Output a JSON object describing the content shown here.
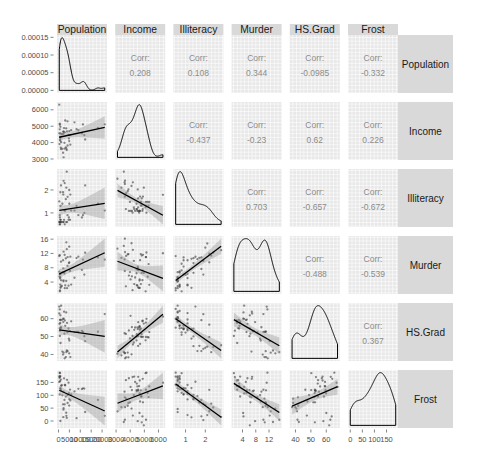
{
  "strips": {
    "top": [
      "Population",
      "Income",
      "Illiteracy",
      "Murder",
      "HS.Grad",
      "Frost"
    ],
    "right": [
      "Population",
      "Income",
      "Illiteracy",
      "Murder",
      "HS.Grad",
      "Frost"
    ]
  },
  "chart_data": {
    "type": "scatter",
    "layout": "scatterplot-matrix",
    "title": "",
    "grid": true,
    "variables": [
      "Population",
      "Income",
      "Illiteracy",
      "Murder",
      "HS.Grad",
      "Frost"
    ],
    "panels": {
      "lower": "scatter points with linear fit line and 95% confidence band",
      "diagonal": "kernel density curve",
      "upper": "correlation coefficient text"
    },
    "colors": {
      "panel_bg": "#E8E8E8",
      "strip_bg": "#D9D9D9",
      "point": "#3a3a3a",
      "fit_line": "#000000",
      "ci_band": "#999999",
      "density_line": "#000000",
      "corr_text": "#8C8C8C"
    },
    "corr_label": "Corr:",
    "correlations": [
      {
        "row": "Population",
        "col": "Income",
        "value": "0.208"
      },
      {
        "row": "Population",
        "col": "Illiteracy",
        "value": "0.108"
      },
      {
        "row": "Population",
        "col": "Murder",
        "value": "0.344"
      },
      {
        "row": "Population",
        "col": "HS.Grad",
        "value": "-0.0985"
      },
      {
        "row": "Population",
        "col": "Frost",
        "value": "-0.332"
      },
      {
        "row": "Income",
        "col": "Illiteracy",
        "value": "-0.437"
      },
      {
        "row": "Income",
        "col": "Murder",
        "value": "-0.23"
      },
      {
        "row": "Income",
        "col": "HS.Grad",
        "value": "0.62"
      },
      {
        "row": "Income",
        "col": "Frost",
        "value": "0.226"
      },
      {
        "row": "Illiteracy",
        "col": "Murder",
        "value": "0.703"
      },
      {
        "row": "Illiteracy",
        "col": "HS.Grad",
        "value": "-0.657"
      },
      {
        "row": "Illiteracy",
        "col": "Frost",
        "value": "-0.672"
      },
      {
        "row": "Murder",
        "col": "HS.Grad",
        "value": "-0.488"
      },
      {
        "row": "Murder",
        "col": "Frost",
        "value": "-0.539"
      },
      {
        "row": "HS.Grad",
        "col": "Frost",
        "value": "0.367"
      }
    ],
    "axis_ticks": {
      "y": [
        {
          "variable": "Population (density)",
          "values": [
            0,
            5e-05,
            0.0001,
            0.00015
          ],
          "labels": [
            "0.00000",
            "0.00005",
            "0.00010",
            "0.00015"
          ]
        },
        {
          "variable": "Income",
          "values": [
            3000,
            4000,
            5000,
            6000
          ],
          "labels": [
            "3000",
            "4000",
            "5000",
            "6000"
          ]
        },
        {
          "variable": "Illiteracy",
          "values": [
            1,
            2
          ],
          "labels": [
            "1",
            "2"
          ]
        },
        {
          "variable": "Murder",
          "values": [
            4,
            8,
            12,
            16
          ],
          "labels": [
            "4",
            "8",
            "12",
            "16"
          ]
        },
        {
          "variable": "HS.Grad",
          "values": [
            40,
            50,
            60
          ],
          "labels": [
            "40",
            "50",
            "60"
          ]
        },
        {
          "variable": "Frost",
          "values": [
            0,
            50,
            100,
            150
          ],
          "labels": [
            "0",
            "50",
            "100",
            "150"
          ]
        }
      ],
      "x": [
        {
          "variable": "Population",
          "values": [
            0,
            5000,
            10000,
            15000,
            20000
          ],
          "labels": [
            "0",
            "5000",
            "10000",
            "15000",
            "20000"
          ]
        },
        {
          "variable": "Income",
          "values": [
            3000,
            4000,
            5000,
            6000
          ],
          "labels": [
            "3000",
            "4000",
            "5000",
            "6000"
          ]
        },
        {
          "variable": "Illiteracy",
          "values": [
            1,
            2
          ],
          "labels": [
            "1",
            "2"
          ]
        },
        {
          "variable": "Murder",
          "values": [
            4,
            8,
            12
          ],
          "labels": [
            "4",
            "8",
            "12"
          ]
        },
        {
          "variable": "HS.Grad",
          "values": [
            40,
            50,
            60
          ],
          "labels": [
            "40",
            "50",
            "60"
          ]
        },
        {
          "variable": "Frost",
          "values": [
            0,
            50,
            100,
            150
          ],
          "labels": [
            "0",
            "50",
            "100",
            "150"
          ]
        }
      ]
    },
    "observations": [
      [
        3615,
        3624,
        2.1,
        15.1,
        41.3,
        20
      ],
      [
        365,
        6315,
        1.5,
        11.3,
        66.7,
        152
      ],
      [
        2212,
        4530,
        1.8,
        7.8,
        58.1,
        15
      ],
      [
        2110,
        3378,
        1.9,
        10.1,
        39.9,
        65
      ],
      [
        21198,
        5114,
        1.1,
        10.3,
        62.6,
        20
      ],
      [
        2541,
        4884,
        0.7,
        6.8,
        63.9,
        166
      ],
      [
        3100,
        5348,
        1.1,
        3.1,
        56.0,
        139
      ],
      [
        579,
        4809,
        0.9,
        6.2,
        54.6,
        103
      ],
      [
        8277,
        4815,
        1.3,
        10.7,
        52.6,
        11
      ],
      [
        4931,
        4091,
        2.0,
        13.9,
        40.6,
        60
      ],
      [
        868,
        4963,
        1.9,
        6.2,
        61.9,
        0
      ],
      [
        813,
        4119,
        0.6,
        5.3,
        59.5,
        126
      ],
      [
        11197,
        5107,
        0.9,
        10.3,
        52.6,
        127
      ],
      [
        5313,
        4458,
        0.7,
        7.1,
        52.9,
        122
      ],
      [
        2861,
        4628,
        0.5,
        2.3,
        59.0,
        140
      ],
      [
        2280,
        4669,
        0.6,
        4.5,
        59.9,
        114
      ],
      [
        3387,
        3712,
        1.6,
        10.6,
        38.5,
        95
      ],
      [
        3806,
        3545,
        2.8,
        13.2,
        42.2,
        12
      ],
      [
        1058,
        3694,
        0.7,
        2.7,
        54.7,
        161
      ],
      [
        4122,
        5299,
        0.9,
        8.5,
        52.3,
        101
      ],
      [
        5814,
        4755,
        1.1,
        3.3,
        58.5,
        103
      ],
      [
        9111,
        4751,
        0.9,
        11.1,
        52.8,
        125
      ],
      [
        3921,
        4675,
        0.6,
        2.3,
        57.6,
        160
      ],
      [
        2341,
        3098,
        2.4,
        12.5,
        41.0,
        50
      ],
      [
        4767,
        4254,
        0.8,
        9.3,
        48.8,
        108
      ],
      [
        746,
        4347,
        0.6,
        5.0,
        59.2,
        155
      ],
      [
        1544,
        4508,
        0.6,
        2.9,
        59.3,
        139
      ],
      [
        590,
        5149,
        0.5,
        11.5,
        65.2,
        188
      ],
      [
        812,
        4281,
        0.7,
        3.3,
        57.6,
        174
      ],
      [
        7333,
        5237,
        1.1,
        5.2,
        52.5,
        115
      ],
      [
        1144,
        3601,
        2.2,
        9.7,
        55.2,
        120
      ],
      [
        18076,
        4903,
        1.4,
        10.9,
        52.7,
        82
      ],
      [
        5441,
        3875,
        1.8,
        11.1,
        38.5,
        80
      ],
      [
        637,
        5087,
        0.8,
        1.4,
        50.3,
        186
      ],
      [
        10735,
        4561,
        0.8,
        7.4,
        53.2,
        124
      ],
      [
        2715,
        3983,
        1.1,
        6.4,
        51.6,
        82
      ],
      [
        2284,
        4660,
        0.6,
        4.2,
        60.0,
        44
      ],
      [
        11860,
        4449,
        1.0,
        6.1,
        50.2,
        126
      ],
      [
        931,
        4558,
        1.3,
        2.4,
        46.4,
        127
      ],
      [
        2816,
        3635,
        2.3,
        11.6,
        37.8,
        65
      ],
      [
        681,
        4167,
        0.5,
        1.7,
        53.3,
        172
      ],
      [
        4173,
        3821,
        1.7,
        11.0,
        41.8,
        70
      ],
      [
        12237,
        4188,
        2.2,
        12.2,
        47.4,
        35
      ],
      [
        1203,
        4022,
        0.6,
        4.5,
        67.3,
        137
      ],
      [
        472,
        3907,
        0.6,
        5.5,
        57.1,
        168
      ],
      [
        4981,
        4701,
        1.4,
        9.5,
        47.8,
        85
      ],
      [
        3559,
        4864,
        0.6,
        4.3,
        63.5,
        32
      ],
      [
        1799,
        3617,
        1.4,
        6.7,
        41.6,
        100
      ],
      [
        4589,
        4468,
        0.7,
        3.0,
        54.5,
        149
      ],
      [
        376,
        4566,
        0.6,
        6.9,
        62.9,
        173
      ]
    ]
  }
}
